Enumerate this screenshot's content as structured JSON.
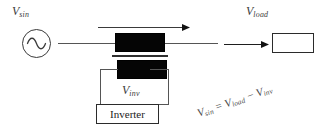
{
  "diagram": {
    "source": {
      "name": "ac-voltage-source",
      "label_v": "V",
      "label_sub": "sin",
      "symbol": "sine-wave"
    },
    "transformer": {
      "primary_name": "primary-winding",
      "secondary_name": "secondary-winding",
      "core_name": "transformer-core"
    },
    "load": {
      "label_v": "V",
      "label_sub": "load",
      "box_label": ""
    },
    "inverter": {
      "box_label": "Inverter",
      "label_v": "V",
      "label_sub": "inv"
    },
    "arrows": {
      "main_current": "current-flow-arrow",
      "load_current": "load-current-arrow"
    },
    "equation": {
      "lhs_v": "V",
      "lhs_sub": "sin",
      "eq": " = ",
      "rhs1_v": "V",
      "rhs1_sub": "load",
      "minus": " − ",
      "rhs2_v": "V",
      "rhs2_sub": "inv"
    },
    "colors": {
      "winding_fill": "#050505",
      "wire": "#555555",
      "box_stroke": "#2b2b2b",
      "text": "#3b3b3b",
      "background": "#ffffff"
    }
  }
}
